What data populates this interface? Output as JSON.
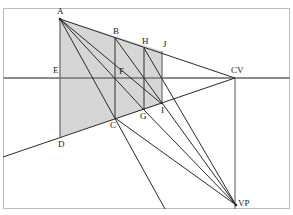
{
  "diagram": {
    "colors": {
      "background": "#ffffff",
      "border": "#bdbdbd",
      "shade": "#d6d6d6",
      "horizon": "#8c8c8c",
      "line": "#2a2a2a",
      "label": "#222222"
    },
    "points": {
      "A": {
        "x": 60,
        "y": 19
      },
      "B": {
        "x": 115,
        "y": 38
      },
      "H": {
        "x": 144,
        "y": 48
      },
      "J": {
        "x": 162,
        "y": 51
      },
      "E": {
        "x": 60,
        "y": 78
      },
      "F": {
        "x": 115,
        "y": 78
      },
      "CV": {
        "x": 235,
        "y": 78
      },
      "D": {
        "x": 60,
        "y": 137
      },
      "C": {
        "x": 115,
        "y": 118
      },
      "G": {
        "x": 144,
        "y": 110
      },
      "I": {
        "x": 162,
        "y": 104
      },
      "VP": {
        "x": 236,
        "y": 205
      }
    },
    "labels": [
      {
        "id": "A",
        "text": "A",
        "x": 57,
        "y": 7
      },
      {
        "id": "B",
        "text": "B",
        "x": 113,
        "y": 27
      },
      {
        "id": "H",
        "text": "H",
        "x": 142,
        "y": 37
      },
      {
        "id": "J",
        "text": "J",
        "x": 164,
        "y": 40
      },
      {
        "id": "E",
        "text": "E",
        "x": 53,
        "y": 66
      },
      {
        "id": "F",
        "text": "F",
        "x": 119,
        "y": 67
      },
      {
        "id": "CV",
        "text": "CV",
        "x": 231,
        "y": 66
      },
      {
        "id": "D",
        "text": "D",
        "x": 58,
        "y": 140
      },
      {
        "id": "C",
        "text": "C",
        "x": 110,
        "y": 121
      },
      {
        "id": "G",
        "text": "G",
        "x": 140,
        "y": 112
      },
      {
        "id": "I",
        "text": "I",
        "x": 161,
        "y": 106
      },
      {
        "id": "VP",
        "text": "VP",
        "x": 238,
        "y": 199
      }
    ]
  }
}
